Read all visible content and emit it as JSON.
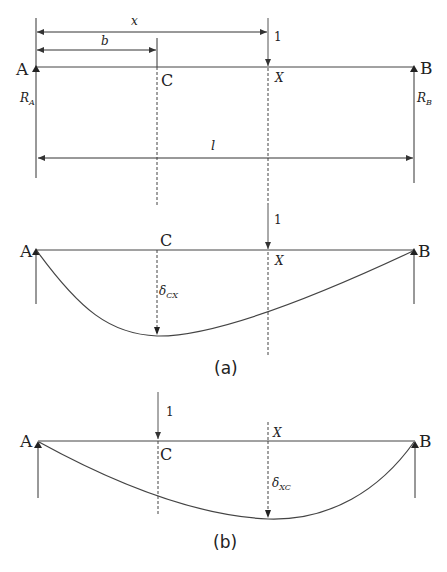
{
  "diagram": {
    "type": "beam-deflection-reciprocity",
    "colors": {
      "line": "#333333",
      "dashed": "#444444",
      "background": "#ffffff"
    },
    "top": {
      "points": {
        "A": "A",
        "B": "B",
        "C": "C",
        "X": "X"
      },
      "reactions": {
        "RA": "R",
        "RA_sub": "A",
        "RB": "R",
        "RB_sub": "B"
      },
      "dimensions": {
        "x": "x",
        "b": "b",
        "l": "l"
      },
      "load": "1"
    },
    "panel_a": {
      "points": {
        "A": "A",
        "B": "B",
        "C": "C",
        "X": "X"
      },
      "load": "1",
      "deflection": "δ",
      "deflection_sub": "CX",
      "caption": "(a)"
    },
    "panel_b": {
      "points": {
        "A": "A",
        "B": "B",
        "C": "C",
        "X": "X"
      },
      "load": "1",
      "deflection": "δ",
      "deflection_sub": "XC",
      "caption": "(b)"
    }
  }
}
